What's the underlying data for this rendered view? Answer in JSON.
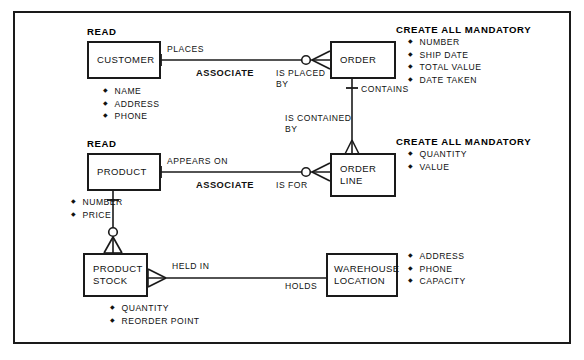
{
  "diagram": {
    "entities": [
      {
        "id": "customer",
        "name_lines": [
          "CUSTOMER"
        ],
        "header": "READ",
        "attributes": [
          "NAME",
          "ADDRESS",
          "PHONE"
        ]
      },
      {
        "id": "order",
        "name_lines": [
          "ORDER"
        ],
        "header": "CREATE ALL MANDATORY",
        "attributes": [
          "NUMBER",
          "SHIP DATE",
          "TOTAL VALUE",
          "DATE TAKEN"
        ]
      },
      {
        "id": "product",
        "name_lines": [
          "PRODUCT"
        ],
        "header": "READ",
        "attributes": [
          "NUMBER",
          "PRICE"
        ]
      },
      {
        "id": "order_line",
        "name_lines": [
          "ORDER",
          "LINE"
        ],
        "header": "CREATE ALL MANDATORY",
        "attributes": [
          "QUANTITY",
          "VALUE"
        ]
      },
      {
        "id": "product_stock",
        "name_lines": [
          "PRODUCT",
          "STOCK"
        ],
        "header": "",
        "attributes": [
          "QUANTITY",
          "REORDER POINT"
        ]
      },
      {
        "id": "warehouse_location",
        "name_lines": [
          "WAREHOUSE",
          "LOCATION"
        ],
        "header": "",
        "attributes": [
          "ADDRESS",
          "PHONE",
          "CAPACITY"
        ]
      }
    ],
    "relationships": [
      {
        "id": "customer_order",
        "from": "customer",
        "to": "order",
        "label_from": "PLACES",
        "label_to_line1": "IS PLACED",
        "label_to_line2": "BY",
        "annotation": "ASSOCIATE"
      },
      {
        "id": "order_orderline",
        "from": "order",
        "to": "order_line",
        "label_from": "CONTAINS",
        "label_to_line1": "IS CONTAINED",
        "label_to_line2": "BY",
        "annotation": ""
      },
      {
        "id": "product_orderline",
        "from": "product",
        "to": "order_line",
        "label_from": "APPEARS ON",
        "label_to_line1": "IS FOR",
        "label_to_line2": "",
        "annotation": "ASSOCIATE"
      },
      {
        "id": "productstock_warehouse",
        "from": "product_stock",
        "to": "warehouse_location",
        "label_from": "HELD IN",
        "label_to_line1": "HOLDS",
        "label_to_line2": "",
        "annotation": ""
      }
    ],
    "colors": {
      "line": "#1a1a1a",
      "text": "#111111",
      "background": "#ffffff"
    }
  }
}
